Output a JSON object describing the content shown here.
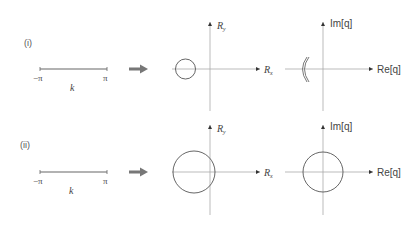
{
  "rows": [
    {
      "label": "(i)",
      "k_line": {
        "left": "−π",
        "right": "π",
        "var": "k"
      },
      "panel_R": {
        "x_axis": "R",
        "x_sub": "x",
        "y_axis": "R",
        "y_sub": "y",
        "shape": "small circle not enclosing origin"
      },
      "panel_q": {
        "x_axis": "Re[q]",
        "y_axis": "Im[q]",
        "shape": "double arc left of origin"
      }
    },
    {
      "label": "(ii)",
      "k_line": {
        "left": "−π",
        "right": "π",
        "var": "k"
      },
      "panel_R": {
        "x_axis": "R",
        "x_sub": "x",
        "y_axis": "R",
        "y_sub": "y",
        "shape": "large circle enclosing origin"
      },
      "panel_q": {
        "x_axis": "Re[q]",
        "y_axis": "Im[q]",
        "shape": "circle centered at origin"
      }
    }
  ],
  "colors": {
    "axis": "#999999",
    "curve": "#555555",
    "arrow": "#777777",
    "kline": "#666666"
  }
}
